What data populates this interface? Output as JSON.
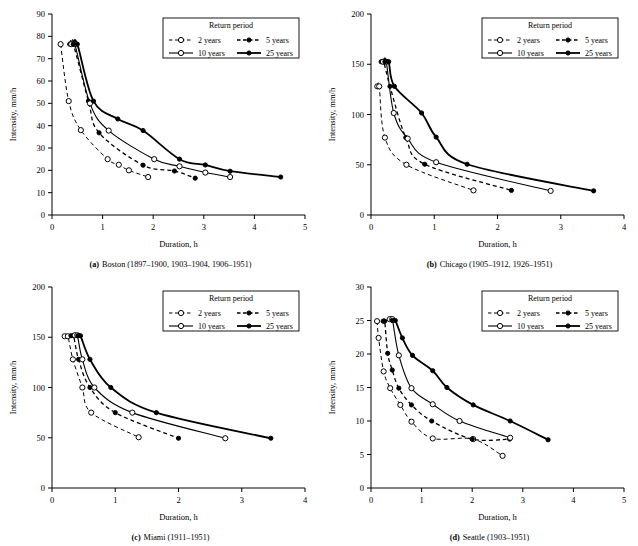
{
  "figure": {
    "panels": [
      "a",
      "b",
      "c",
      "d"
    ]
  },
  "legend": {
    "title": "Return period",
    "entries": [
      {
        "label": "2 years",
        "style": "dashed",
        "marker": "open",
        "width": 1.0
      },
      {
        "label": "5 years",
        "style": "dashed",
        "marker": "filled",
        "width": 1.3
      },
      {
        "label": "10 years",
        "style": "solid",
        "marker": "open",
        "width": 1.1
      },
      {
        "label": "25 years",
        "style": "solid",
        "marker": "filled",
        "width": 1.8
      }
    ]
  },
  "chart_data": [
    {
      "id": "a",
      "type": "line",
      "title": "Boston (1897–1900, 1903–1904, 1906–1951)",
      "caption_prefix": "(a)",
      "caption_text": "Boston (1897–1900, 1903–1904, 1906–1951)",
      "xlabel": "Duration, h",
      "ylabel": "Intensity, mm/h",
      "xlim": [
        0,
        5
      ],
      "ylim": [
        0,
        90
      ],
      "xticks": [
        0,
        1,
        2,
        3,
        4,
        5
      ],
      "yticks": [
        0,
        10,
        20,
        30,
        40,
        50,
        60,
        70,
        80,
        90
      ],
      "grid": false,
      "legend_position": "top-right",
      "series": [
        {
          "name": "2 years",
          "x": [
            0.17,
            0.33,
            0.57,
            1.1,
            1.32,
            1.52,
            1.9
          ],
          "y": [
            76.5,
            51.0,
            38.0,
            25.0,
            22.5,
            20.0,
            17.0
          ]
        },
        {
          "name": "5 years",
          "x": [
            0.35,
            0.42,
            0.72,
            0.93,
            1.8,
            2.42,
            2.83
          ],
          "y": [
            76.5,
            76.5,
            51.0,
            36.8,
            22.3,
            19.7,
            16.5
          ]
        },
        {
          "name": "10 years",
          "x": [
            0.38,
            0.45,
            0.75,
            1.12,
            2.02,
            2.52,
            3.03,
            3.52
          ],
          "y": [
            76.5,
            76.5,
            50.0,
            37.8,
            25.0,
            21.8,
            19.0,
            17.0
          ]
        },
        {
          "name": "25 years",
          "x": [
            0.42,
            0.5,
            0.82,
            1.3,
            1.8,
            2.52,
            3.03,
            3.52,
            4.52
          ],
          "y": [
            76.5,
            76.5,
            51.0,
            43.0,
            37.8,
            25.0,
            22.4,
            19.6,
            17.0
          ]
        }
      ]
    },
    {
      "id": "b",
      "type": "line",
      "title": "Chicago (1905–1912, 1926–1951)",
      "caption_prefix": "(b)",
      "caption_text": "Chicago (1905–1912, 1926–1951)",
      "xlabel": "Duration, h",
      "ylabel": "Intensity, mm/h",
      "xlim": [
        0,
        4
      ],
      "ylim": [
        0,
        200
      ],
      "xticks": [
        0,
        1,
        2,
        3,
        4
      ],
      "yticks": [
        0,
        50,
        100,
        150,
        200
      ],
      "grid": false,
      "legend_position": "top-right",
      "legend_has_sep_line": true,
      "series": [
        {
          "name": "2 years",
          "x": [
            0.1,
            0.13,
            0.22,
            0.56,
            1.62
          ],
          "y": [
            128.0,
            128.0,
            77.0,
            50.0,
            24.5
          ]
        },
        {
          "name": "5 years",
          "x": [
            0.16,
            0.2,
            0.3,
            0.55,
            0.85,
            2.22
          ],
          "y": [
            152.5,
            152.5,
            128.0,
            77.0,
            50.5,
            24.5
          ]
        },
        {
          "name": "10 years",
          "x": [
            0.19,
            0.24,
            0.36,
            0.58,
            1.03,
            2.84
          ],
          "y": [
            152.5,
            152.5,
            101.5,
            76.0,
            52.5,
            24.0
          ]
        },
        {
          "name": "25 years",
          "x": [
            0.22,
            0.28,
            0.37,
            0.8,
            1.03,
            1.52,
            3.52
          ],
          "y": [
            152.5,
            152.5,
            128.0,
            101.5,
            77.5,
            50.5,
            24.0
          ]
        }
      ]
    },
    {
      "id": "c",
      "type": "line",
      "title": "Miami (1911–1951)",
      "caption_prefix": "(c)",
      "caption_text": "Miami (1911–1951)",
      "xlabel": "Duration, h",
      "ylabel": "Intensity, mm/h",
      "xlim": [
        0,
        4
      ],
      "ylim": [
        0,
        200
      ],
      "xticks": [
        0,
        1,
        2,
        3,
        4
      ],
      "yticks": [
        0,
        50,
        100,
        150,
        200
      ],
      "grid": false,
      "legend_position": "top-right",
      "series": [
        {
          "name": "2 years",
          "x": [
            0.2,
            0.25,
            0.33,
            0.48,
            0.62,
            1.37
          ],
          "y": [
            151.0,
            151.0,
            128.0,
            100.0,
            75.0,
            50.5
          ]
        },
        {
          "name": "5 years",
          "x": [
            0.3,
            0.34,
            0.42,
            0.6,
            1.0,
            2.0
          ],
          "y": [
            151.5,
            151.5,
            128.0,
            100.0,
            75.0,
            49.5
          ]
        },
        {
          "name": "10 years",
          "x": [
            0.36,
            0.4,
            0.48,
            0.67,
            1.27,
            2.74
          ],
          "y": [
            152.0,
            152.0,
            128.0,
            100.0,
            75.0,
            49.5
          ]
        },
        {
          "name": "25 years",
          "x": [
            0.41,
            0.45,
            0.6,
            0.93,
            1.65,
            3.46
          ],
          "y": [
            151.5,
            151.5,
            128.0,
            100.0,
            75.0,
            49.5
          ]
        }
      ]
    },
    {
      "id": "d",
      "type": "line",
      "title": "Seattle (1903–1951)",
      "caption_prefix": "(d)",
      "caption_text": "Seattle (1903–1951)",
      "xlabel": "Duration, h",
      "ylabel": "Intensity, mm/h",
      "xlim": [
        0,
        5
      ],
      "ylim": [
        0,
        30
      ],
      "xticks": [
        0,
        1,
        2,
        3,
        4,
        5
      ],
      "yticks": [
        0,
        5,
        10,
        15,
        20,
        25,
        30
      ],
      "grid": false,
      "legend_position": "top-right",
      "series": [
        {
          "name": "2 years",
          "x": [
            0.12,
            0.15,
            0.25,
            0.38,
            0.58,
            0.8,
            1.22,
            2.02,
            2.6
          ],
          "y": [
            24.9,
            22.4,
            17.4,
            14.9,
            12.4,
            9.9,
            7.4,
            7.3,
            4.8
          ]
        },
        {
          "name": "5 years",
          "x": [
            0.24,
            0.27,
            0.33,
            0.42,
            0.55,
            0.8,
            1.2,
            2.0,
            2.74
          ],
          "y": [
            24.9,
            24.9,
            20.1,
            17.6,
            14.9,
            12.4,
            10.0,
            7.3,
            7.3
          ]
        },
        {
          "name": "10 years",
          "x": [
            0.37,
            0.42,
            0.55,
            0.8,
            1.22,
            1.75,
            2.75
          ],
          "y": [
            25.2,
            25.2,
            19.8,
            14.9,
            12.5,
            10.0,
            7.5
          ]
        },
        {
          "name": "25 years",
          "x": [
            0.42,
            0.48,
            0.62,
            0.82,
            1.22,
            1.5,
            2.02,
            2.75,
            3.5
          ],
          "y": [
            25.0,
            25.0,
            22.4,
            19.8,
            17.5,
            15.0,
            12.4,
            10.0,
            7.2
          ]
        }
      ]
    }
  ]
}
